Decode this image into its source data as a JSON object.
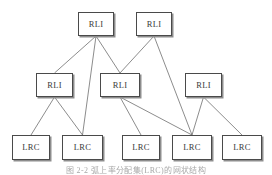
{
  "figure": {
    "caption": "图 2-2  弧上率分配集(LRC)的网状结构",
    "caption_top": 164,
    "background": "#ffffff",
    "box_border_color": "#4a4a4a",
    "box_shadow_color": "#8d8d8d",
    "edge_color": "#6f6f6f",
    "width": 272,
    "height": 175
  },
  "chart_data": {
    "type": "diagram",
    "title": "",
    "levels": [
      {
        "name": "level-1",
        "node_type": "RLI",
        "count": 2
      },
      {
        "name": "level-2",
        "node_type": "RLI",
        "count": 3
      },
      {
        "name": "level-3",
        "node_type": "LRC",
        "count": 5
      }
    ],
    "nodes": [
      {
        "id": "t1",
        "label": "RLI",
        "level": 1,
        "x": 78,
        "y": 12,
        "w": 36,
        "h": 24
      },
      {
        "id": "t2",
        "label": "RLI",
        "level": 1,
        "x": 136,
        "y": 12,
        "w": 36,
        "h": 24
      },
      {
        "id": "m1",
        "label": "RLI",
        "level": 2,
        "x": 36,
        "y": 73,
        "w": 37,
        "h": 24
      },
      {
        "id": "m2",
        "label": "RLI",
        "level": 2,
        "x": 100,
        "y": 73,
        "w": 40,
        "h": 24
      },
      {
        "id": "m3",
        "label": "RLI",
        "level": 2,
        "x": 185,
        "y": 73,
        "w": 37,
        "h": 24
      },
      {
        "id": "b1",
        "label": "LRC",
        "level": 3,
        "x": 12,
        "y": 135,
        "w": 38,
        "h": 25
      },
      {
        "id": "b2",
        "label": "LRC",
        "level": 3,
        "x": 62,
        "y": 135,
        "w": 41,
        "h": 25
      },
      {
        "id": "b3",
        "label": "LRC",
        "level": 3,
        "x": 122,
        "y": 135,
        "w": 38,
        "h": 25
      },
      {
        "id": "b4",
        "label": "LRC",
        "level": 3,
        "x": 172,
        "y": 135,
        "w": 40,
        "h": 25
      },
      {
        "id": "b5",
        "label": "LRC",
        "level": 3,
        "x": 222,
        "y": 135,
        "w": 40,
        "h": 25
      }
    ],
    "edges": [
      {
        "from": "t1",
        "to": "m1"
      },
      {
        "from": "t1",
        "to": "m2"
      },
      {
        "from": "t1",
        "to": "b2"
      },
      {
        "from": "t2",
        "to": "m2"
      },
      {
        "from": "t2",
        "to": "b4"
      },
      {
        "from": "m1",
        "to": "b1"
      },
      {
        "from": "m1",
        "to": "b2"
      },
      {
        "from": "m2",
        "to": "b3"
      },
      {
        "from": "m2",
        "to": "b4"
      },
      {
        "from": "m3",
        "to": "b4"
      },
      {
        "from": "m3",
        "to": "b5"
      }
    ]
  }
}
